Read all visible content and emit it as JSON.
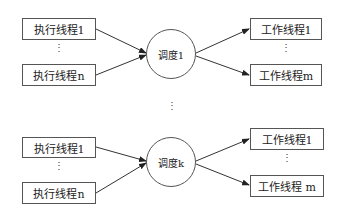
{
  "groups": [
    {
      "inputs": [
        "执行线程1",
        "执行线程n"
      ],
      "scheduler": "调度1",
      "outputs": [
        "工作线程1",
        "工作线程m"
      ]
    },
    {
      "inputs": [
        "执行线程1",
        "执行线程n"
      ],
      "scheduler": "调度k",
      "outputs": [
        "工作线程1",
        "工作线程 m"
      ]
    }
  ],
  "ellipsis": "⋮"
}
